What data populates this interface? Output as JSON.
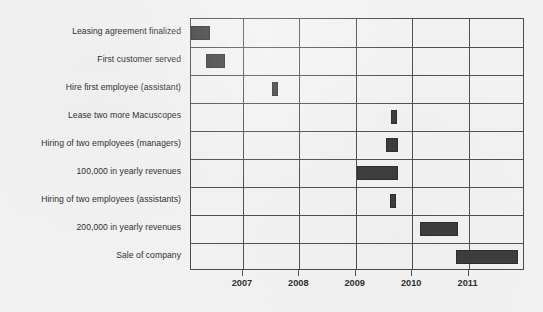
{
  "chart_data": {
    "type": "bar",
    "subtype": "gantt",
    "title": "",
    "xlabel": "",
    "ylabel": "",
    "grid": true,
    "legend": null,
    "xlim": [
      2006.08,
      2012.0
    ],
    "xticks": [
      2007,
      2008,
      2009,
      2010,
      2011
    ],
    "xtick_labels": [
      "2007",
      "2008",
      "2009",
      "2010",
      "2011"
    ],
    "categories": [
      "Leasing agreement finalized",
      "First customer served",
      "Hire first employee (assistant)",
      "Lease two more Macuscopes",
      "Hiring of two employees (managers)",
      "100,000 in yearly revenues",
      "Hiring of two employees (assistants)",
      "200,000 in yearly revenues",
      "Sale of company"
    ],
    "bars": [
      {
        "label": "Leasing agreement finalized",
        "start": 2006.08,
        "end": 2006.42
      },
      {
        "label": "First customer served",
        "start": 2006.35,
        "end": 2006.68
      },
      {
        "label": "Hire first employee (assistant)",
        "start": 2007.51,
        "end": 2007.62
      },
      {
        "label": "Lease two more Macuscopes",
        "start": 2009.62,
        "end": 2009.73
      },
      {
        "label": "Hiring of two employees (managers)",
        "start": 2009.53,
        "end": 2009.75
      },
      {
        "label": "100,000 in yearly revenues",
        "start": 2009.03,
        "end": 2009.75
      },
      {
        "label": "Hiring of two employees (assistants)",
        "start": 2009.6,
        "end": 2009.71
      },
      {
        "label": "200,000 in yearly revenues",
        "start": 2010.14,
        "end": 2010.82
      },
      {
        "label": "Sale of company",
        "start": 2010.78,
        "end": 2011.87
      }
    ],
    "colors": {
      "bar_fill": "#3b3b3b",
      "bar_stroke": "#2c2c2c",
      "grid_line": "#4f4f4f",
      "frame": "#4a4a4a",
      "background": "#f3f3f3",
      "text": "#2d2d2d"
    }
  }
}
